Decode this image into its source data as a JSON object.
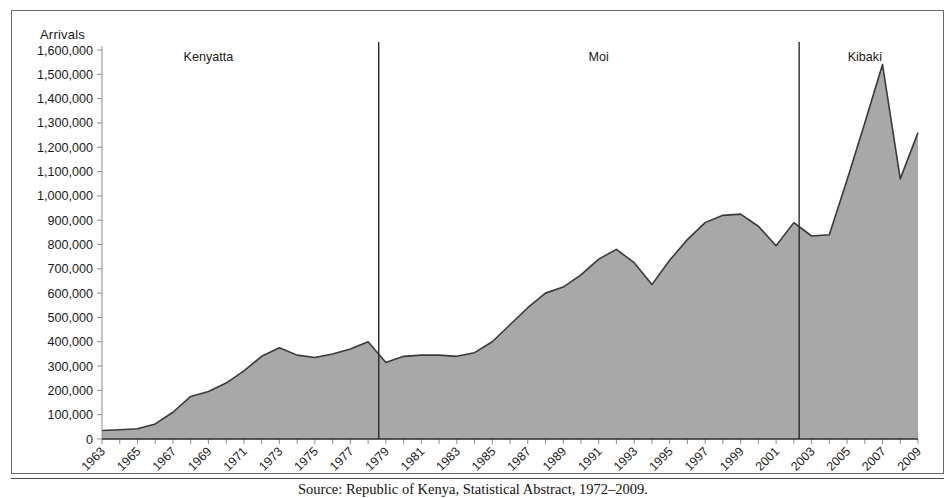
{
  "figure": {
    "axis_title": "Arrivals",
    "caption": "Source: Republic of Kenya, Statistical Abstract, 1972–2009.",
    "frame_color": "#6a6a6a"
  },
  "chart_data": {
    "type": "area",
    "title": "",
    "subtitle": "",
    "xlabel": "",
    "ylabel": "Arrivals",
    "grid": false,
    "legend": "none",
    "fill_color": "#a8a8a8",
    "line_color": "#3a3a3a",
    "ylim": [
      0,
      1600000
    ],
    "xlim": [
      1963,
      2009
    ],
    "ytick_labels": [
      "1,600,000",
      "1,500,000",
      "1,400,000",
      "1,300,000",
      "1,200,000",
      "1,100,000",
      "1,000,000",
      "900,000",
      "800,000",
      "700,000",
      "600,000",
      "500,000",
      "400,000",
      "300,000",
      "200,000",
      "100,000",
      "0"
    ],
    "ytick_values": [
      1600000,
      1500000,
      1400000,
      1300000,
      1200000,
      1100000,
      1000000,
      900000,
      800000,
      700000,
      600000,
      500000,
      400000,
      300000,
      200000,
      100000,
      0
    ],
    "xtick_labels": [
      "1963",
      "1965",
      "1967",
      "1969",
      "1971",
      "1973",
      "1975",
      "1977",
      "1979",
      "1981",
      "1983",
      "1985",
      "1987",
      "1989",
      "1991",
      "1993",
      "1995",
      "1997",
      "1999",
      "2001",
      "2003",
      "2005",
      "2007",
      "2009"
    ],
    "xtick_values": [
      1963,
      1965,
      1967,
      1969,
      1971,
      1973,
      1975,
      1977,
      1979,
      1981,
      1983,
      1985,
      1987,
      1989,
      1991,
      1993,
      1995,
      1997,
      1999,
      2001,
      2003,
      2005,
      2007,
      2009
    ],
    "x": [
      1963,
      1964,
      1965,
      1966,
      1967,
      1968,
      1969,
      1970,
      1971,
      1972,
      1973,
      1974,
      1975,
      1976,
      1977,
      1978,
      1979,
      1980,
      1981,
      1982,
      1983,
      1984,
      1985,
      1986,
      1987,
      1988,
      1989,
      1990,
      1991,
      1992,
      1993,
      1994,
      1995,
      1996,
      1997,
      1998,
      1999,
      2000,
      2001,
      2002,
      2003,
      2004,
      2005,
      2006,
      2007,
      2008,
      2009
    ],
    "values": [
      35000,
      38000,
      42000,
      62000,
      110000,
      175000,
      195000,
      230000,
      280000,
      340000,
      375000,
      345000,
      335000,
      350000,
      370000,
      400000,
      315000,
      340000,
      345000,
      345000,
      340000,
      355000,
      400000,
      470000,
      540000,
      600000,
      625000,
      675000,
      740000,
      780000,
      725000,
      635000,
      735000,
      820000,
      890000,
      920000,
      925000,
      875000,
      795000,
      890000,
      835000,
      840000,
      1065000,
      1300000,
      1540000,
      1070000,
      1260000
    ],
    "annotations": [
      {
        "label": "Kenyatta",
        "x_center": 1969,
        "type": "era-label"
      },
      {
        "label": "Moi",
        "x_center": 1991,
        "type": "era-label"
      },
      {
        "label": "Kibaki",
        "x_center": 2006,
        "type": "era-label"
      }
    ],
    "dividers": [
      {
        "label": "Kenyatta/Moi boundary",
        "x": 1978.6
      },
      {
        "label": "Moi/Kibaki boundary",
        "x": 2002.3
      }
    ]
  }
}
